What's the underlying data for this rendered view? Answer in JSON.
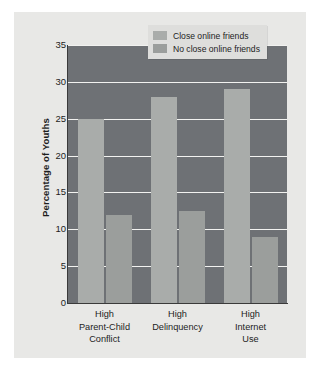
{
  "chart_data": {
    "type": "bar",
    "title": "",
    "subtitle": "",
    "xlabel": "",
    "ylabel": "Percentage of Youths",
    "categories": [
      "High\nParent-Child\nConflict",
      "High\nDelinquency",
      "High\nInternet\nUse"
    ],
    "category_lines": [
      [
        "High",
        "Parent-Child",
        "Conflict"
      ],
      [
        "High",
        "Delinquency"
      ],
      [
        "High",
        "Internet",
        "Use"
      ]
    ],
    "series": [
      {
        "name": "Close online friends",
        "values": [
          25,
          28,
          29
        ],
        "color": "#a9acaa"
      },
      {
        "name": "No close online friends",
        "values": [
          12,
          12.5,
          9
        ],
        "color": "#9b9e9c"
      }
    ],
    "ylim": [
      0,
      35
    ],
    "ytick_values": [
      0,
      5,
      10,
      15,
      20,
      25,
      30,
      35
    ],
    "ytick_labels": [
      "0",
      "5",
      "10",
      "15",
      "20",
      "25",
      "30",
      "35"
    ],
    "grid": true,
    "grid_color": "#f2f2f0",
    "legend_position": "top-right",
    "plot_background": "#6e7175",
    "figure_background": "#e8e8e6"
  },
  "legend": {
    "entries": [
      {
        "label": "Close online friends",
        "swatch_name": "legend-swatch-close-online-friends"
      },
      {
        "label": "No close online friends",
        "swatch_name": "legend-swatch-no-close-online-friends"
      }
    ]
  }
}
